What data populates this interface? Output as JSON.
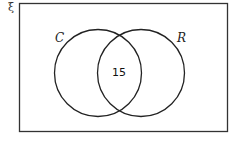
{
  "diagram": {
    "type": "venn",
    "universal_symbol": "ξ",
    "sets": [
      {
        "label": "C"
      },
      {
        "label": "R"
      }
    ],
    "regions": {
      "C_only": "",
      "intersection": "15",
      "R_only": "",
      "outside": ""
    },
    "colors": {
      "stroke": "#222222",
      "background": "#ffffff"
    }
  }
}
